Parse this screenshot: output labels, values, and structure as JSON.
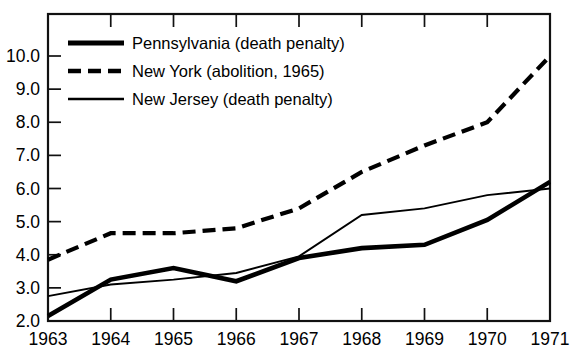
{
  "chart_data": {
    "type": "line",
    "title": "",
    "xlabel": "",
    "ylabel": "",
    "x": [
      1963,
      1964,
      1965,
      1966,
      1967,
      1968,
      1969,
      1970,
      1971
    ],
    "xtick_labels": [
      "1963",
      "1964",
      "1965",
      "1966",
      "1967",
      "1968",
      "1969",
      "1970",
      "1971"
    ],
    "ytick_labels": [
      "2.0",
      "3.0",
      "4.0",
      "5.0",
      "6.0",
      "7.0",
      "8.0",
      "9.0",
      "10.0"
    ],
    "ytick_values": [
      2.0,
      3.0,
      4.0,
      5.0,
      6.0,
      7.0,
      8.0,
      9.0,
      10.0
    ],
    "xlim": [
      1963,
      1971
    ],
    "ylim": [
      2.0,
      10.6
    ],
    "grid": false,
    "legend_position": "upper-left-inside",
    "series": [
      {
        "name": "Pennsylvania (death penalty)",
        "style": "solid-thick",
        "color": "#000000",
        "values": [
          2.15,
          3.25,
          3.6,
          3.2,
          3.9,
          4.2,
          4.3,
          5.05,
          6.2
        ]
      },
      {
        "name": "New York (abolition, 1965)",
        "style": "dashed",
        "color": "#000000",
        "values": [
          3.85,
          4.65,
          4.65,
          4.8,
          5.4,
          6.5,
          7.3,
          8.0,
          10.0
        ]
      },
      {
        "name": "New Jersey (death penalty)",
        "style": "solid-thin",
        "color": "#000000",
        "values": [
          2.75,
          3.1,
          3.25,
          3.45,
          3.95,
          5.2,
          5.4,
          5.8,
          6.0
        ]
      }
    ]
  },
  "legend": {
    "items": [
      {
        "label": "Pennsylvania (death penalty)",
        "style": "solid-thick"
      },
      {
        "label": "New York (abolition, 1965)",
        "style": "dashed"
      },
      {
        "label": "New Jersey (death penalty)",
        "style": "solid-thin"
      }
    ]
  },
  "axes": {
    "y_labels": [
      "10.0",
      "9.0",
      "8.0",
      "7.0",
      "6.0",
      "5.0",
      "4.0",
      "3.0",
      "2.0"
    ],
    "x_labels": [
      "1963",
      "1964",
      "1965",
      "1966",
      "1967",
      "1968",
      "1969",
      "1970",
      "1971"
    ]
  }
}
